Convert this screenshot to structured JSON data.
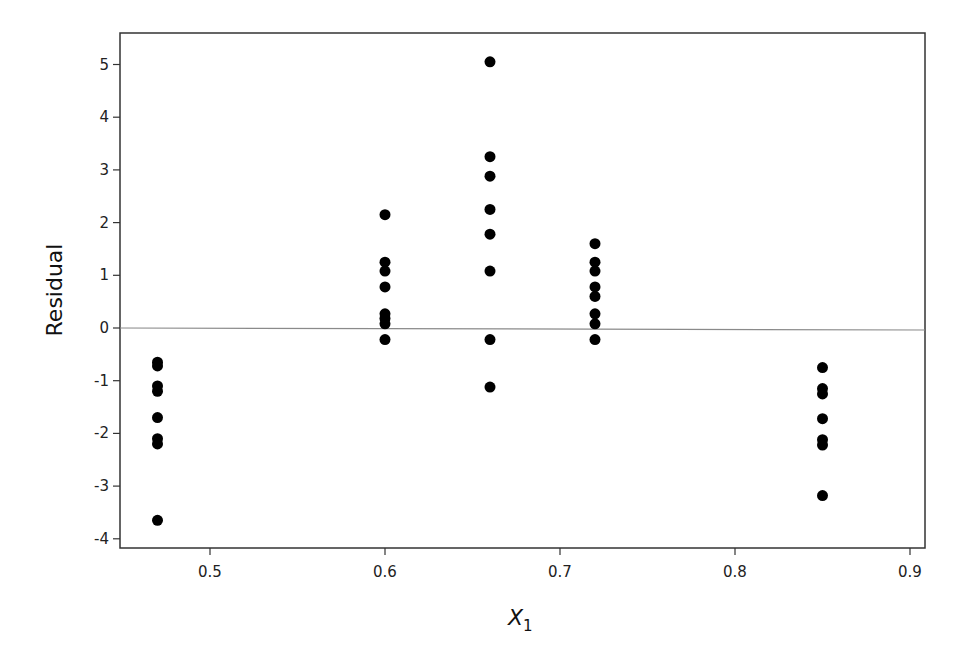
{
  "chart_data": {
    "type": "scatter",
    "title": "",
    "xlabel": "X",
    "xlabel_subscript": "1",
    "ylabel": "Residual",
    "xlim": [
      0.455,
      0.908
    ],
    "ylim": [
      -4.15,
      5.6
    ],
    "x_ticks": [
      0.5,
      0.6,
      0.7,
      0.8,
      0.9
    ],
    "x_tick_labels": [
      "0.5",
      "0.6",
      "0.7",
      "0.8",
      "0.9"
    ],
    "y_ticks": [
      -4,
      -3,
      -2,
      -1,
      0,
      1,
      2,
      3,
      4,
      5
    ],
    "y_tick_labels": [
      "-4",
      "-3",
      "-2",
      "-1",
      "0",
      "1",
      "2",
      "3",
      "4",
      "5"
    ],
    "grid": false,
    "reference_line": {
      "y": 0,
      "color": "#8a8a8a"
    },
    "marker_color": "#000000",
    "series": [
      {
        "name": "Residuals",
        "points": [
          {
            "x": 0.47,
            "y": -0.65
          },
          {
            "x": 0.47,
            "y": -0.72
          },
          {
            "x": 0.47,
            "y": -1.1
          },
          {
            "x": 0.47,
            "y": -1.2
          },
          {
            "x": 0.47,
            "y": -1.7
          },
          {
            "x": 0.47,
            "y": -2.1
          },
          {
            "x": 0.47,
            "y": -2.2
          },
          {
            "x": 0.47,
            "y": -3.65
          },
          {
            "x": 0.6,
            "y": 2.15
          },
          {
            "x": 0.6,
            "y": 1.25
          },
          {
            "x": 0.6,
            "y": 1.08
          },
          {
            "x": 0.6,
            "y": 0.78
          },
          {
            "x": 0.6,
            "y": 0.27
          },
          {
            "x": 0.6,
            "y": 0.18
          },
          {
            "x": 0.6,
            "y": 0.08
          },
          {
            "x": 0.6,
            "y": -0.22
          },
          {
            "x": 0.66,
            "y": 5.05
          },
          {
            "x": 0.66,
            "y": 3.25
          },
          {
            "x": 0.66,
            "y": 2.88
          },
          {
            "x": 0.66,
            "y": 2.25
          },
          {
            "x": 0.66,
            "y": 1.78
          },
          {
            "x": 0.66,
            "y": 1.08
          },
          {
            "x": 0.66,
            "y": -0.22
          },
          {
            "x": 0.66,
            "y": -1.12
          },
          {
            "x": 0.72,
            "y": 1.6
          },
          {
            "x": 0.72,
            "y": 1.25
          },
          {
            "x": 0.72,
            "y": 1.08
          },
          {
            "x": 0.72,
            "y": 0.78
          },
          {
            "x": 0.72,
            "y": 0.6
          },
          {
            "x": 0.72,
            "y": 0.27
          },
          {
            "x": 0.72,
            "y": 0.08
          },
          {
            "x": 0.72,
            "y": -0.22
          },
          {
            "x": 0.85,
            "y": -0.75
          },
          {
            "x": 0.85,
            "y": -1.15
          },
          {
            "x": 0.85,
            "y": -1.25
          },
          {
            "x": 0.85,
            "y": -1.72
          },
          {
            "x": 0.85,
            "y": -2.12
          },
          {
            "x": 0.85,
            "y": -2.22
          },
          {
            "x": 0.85,
            "y": -3.18
          }
        ]
      }
    ]
  }
}
